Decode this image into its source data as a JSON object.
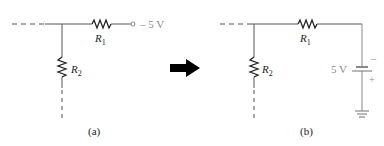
{
  "circuit_a": {
    "caption": "(a)",
    "r1_label": "R",
    "r1_sub": "1",
    "r2_label": "R",
    "r2_sub": "2",
    "source_label": "– 5 V"
  },
  "arrow": {
    "direction": "right",
    "color": "#000000"
  },
  "circuit_b": {
    "caption": "(b)",
    "r1_label": "R",
    "r1_sub": "1",
    "r2_label": "R",
    "r2_sub": "2",
    "battery_label": "5 V",
    "battery_minus": "–",
    "battery_plus": "+"
  },
  "colors": {
    "wire": "#555555",
    "label_gray": "#8a8a8a",
    "text": "#222222"
  }
}
